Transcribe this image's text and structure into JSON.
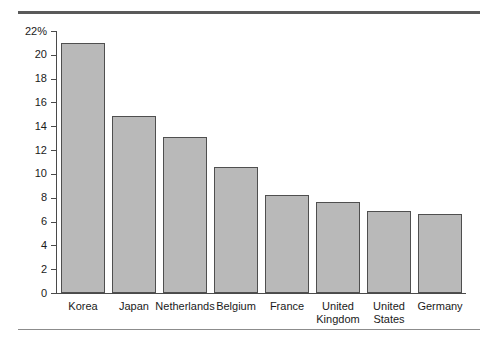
{
  "chart_data": {
    "type": "bar",
    "title": "",
    "subtitle": "",
    "xlabel": "",
    "ylabel": "",
    "categories": [
      "Korea",
      "Japan",
      "Netherlands",
      "Belgium",
      "France",
      "United Kingdom",
      "United States",
      "Germany"
    ],
    "values": [
      21.0,
      14.9,
      13.1,
      10.6,
      8.2,
      7.6,
      6.9,
      6.6
    ],
    "ylim": [
      0,
      22
    ],
    "ytick_values": [
      0,
      2,
      4,
      6,
      8,
      10,
      12,
      14,
      16,
      18,
      20,
      22
    ],
    "ytick_labels": [
      "0",
      "2",
      "4",
      "6",
      "8",
      "10",
      "12",
      "14",
      "16",
      "18",
      "20",
      "22%"
    ],
    "grid": false,
    "legend": null,
    "legend_position": "none",
    "annotations": [],
    "bar_color": "#b9b9b9",
    "bar_border_color": "#4f4f4f",
    "axis_color": "#4a4a4a"
  },
  "decorations": {
    "top_rule_color": "#5a5a5a",
    "bottom_rule_color": "#8c8c8c"
  }
}
